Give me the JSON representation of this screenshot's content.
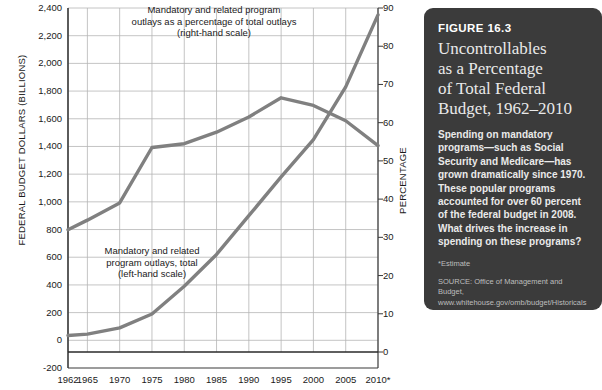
{
  "chart_data": {
    "type": "line",
    "title": "",
    "xlabel": "",
    "ylabel": "FEDERAL BUDGET DOLLARS (BILLIONS)",
    "y2label": "PERCENTAGE",
    "grid": true,
    "legend": "annotations",
    "x": [
      1962,
      1965,
      1970,
      1975,
      1980,
      1985,
      1990,
      1995,
      2000,
      2005,
      2010
    ],
    "xtick_labels": [
      "1962",
      "1965",
      "1970",
      "1975",
      "1980",
      "1985",
      "1990",
      "1995",
      "2000",
      "2005",
      "2010*"
    ],
    "ylim": [
      -200,
      2400
    ],
    "ytick_labels": [
      "2,400",
      "2,200",
      "2,000",
      "1,800",
      "1,600",
      "1,400",
      "1,200",
      "1,000",
      "800",
      "600",
      "400",
      "200",
      "0",
      "-200"
    ],
    "yticks": [
      2400,
      2200,
      2000,
      1800,
      1600,
      1400,
      1200,
      1000,
      800,
      600,
      400,
      200,
      0,
      -200
    ],
    "y2lim": [
      0,
      90
    ],
    "y2tick_labels": [
      "90",
      "80",
      "70",
      "60",
      "50",
      "40",
      "30",
      "20",
      "10",
      "0"
    ],
    "y2ticks": [
      90,
      80,
      70,
      60,
      50,
      40,
      30,
      20,
      10,
      0
    ],
    "series": [
      {
        "name": "Mandatory and related program outlays, total (left-hand scale)",
        "axis": "left",
        "color": "#808080",
        "x": [
          1962,
          1965,
          1970,
          1975,
          1980,
          1985,
          1990,
          1995,
          2000,
          2005,
          2010
        ],
        "values": [
          35,
          45,
          90,
          190,
          390,
          620,
          900,
          1180,
          1450,
          1830,
          2350
        ]
      },
      {
        "name": "Mandatory and related program outlays as a percentage of total outlays (right-hand scale)",
        "axis": "right",
        "color": "#808080",
        "x": [
          1962,
          1965,
          1970,
          1975,
          1980,
          1985,
          1990,
          1995,
          2000,
          2005,
          2010
        ],
        "values": [
          32.0,
          34.5,
          39.0,
          53.5,
          54.5,
          57.5,
          61.5,
          66.5,
          64.5,
          60.5,
          54.0
        ]
      }
    ],
    "annotations": [
      {
        "name": "percentage-series-note",
        "text": "Mandatory and related program\noutlays as a percentage of total outlays\n(right-hand scale)"
      },
      {
        "name": "dollars-series-note",
        "text": "Mandatory and related\nprogram outlays, total\n(left-hand scale)"
      }
    ]
  },
  "figure_panel": {
    "number": "FIGURE 16.3",
    "title": "Uncontrollables\nas a Percentage\nof Total Federal\nBudget, 1962–2010",
    "body": "Spending on mandatory programs—such as Social Security and Medicare—has grown dramatically since 1970. These popular programs accounted for over 60 percent of the federal budget in 2008. What drives the increase in spending on these programs?",
    "estimate_note": "*Estimate",
    "source": "SOURCE: Office of Management and Budget,\nwww.whitehouse.gov/omb/budget/Historicals\n(accessed 3/7/10).",
    "background_color": "#3b3b3b",
    "text_color": "#eaeaea"
  }
}
